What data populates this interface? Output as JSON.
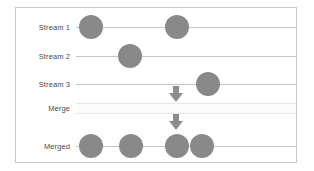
{
  "figure": {
    "frame": {
      "x": 15,
      "y": 7,
      "width": 282,
      "height": 156,
      "border_color": "#c9c9c9"
    },
    "colors": {
      "event_fill": "#898989",
      "line": "#c4c4c4",
      "arrow": "#8c8c8c",
      "merge_band_fill": "#fbfbfb",
      "label_text": "#4a4a4a",
      "background": "#ffffff"
    },
    "line_start_x": 76,
    "line_end_x": 296
  },
  "rows": [
    {
      "label": "Stream 1",
      "kind": "line",
      "y": 27,
      "events": [
        {
          "cx": 91,
          "r": 12
        },
        {
          "cx": 177,
          "r": 12
        }
      ]
    },
    {
      "label": "Stream 2",
      "kind": "line",
      "y": 56,
      "events": [
        {
          "cx": 130,
          "r": 12
        }
      ]
    },
    {
      "label": "Stream 3",
      "kind": "line",
      "y": 84,
      "events": [
        {
          "cx": 208,
          "r": 12
        }
      ]
    },
    {
      "label": "Merge",
      "kind": "band",
      "y": 108,
      "events": []
    },
    {
      "label": "Merged",
      "kind": "line",
      "y": 146,
      "events": [
        {
          "cx": 91,
          "r": 12
        },
        {
          "cx": 131,
          "r": 12
        },
        {
          "cx": 177,
          "r": 12
        },
        {
          "cx": 202,
          "r": 12
        }
      ]
    }
  ],
  "arrows": [
    {
      "name": "arrow-streams-to-merge",
      "cx": 176,
      "top": 86,
      "direction": "down"
    },
    {
      "name": "arrow-merge-to-merged",
      "cx": 176,
      "top": 114,
      "direction": "down"
    }
  ]
}
